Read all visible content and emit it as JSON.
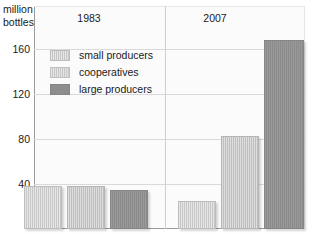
{
  "chart_data": {
    "type": "bar",
    "title": "",
    "subtitle": "",
    "xlabel": "",
    "ylabel": "million bottles",
    "ylabel_lines": [
      "million",
      "bottles"
    ],
    "categories": [
      "1983",
      "2007"
    ],
    "series": [
      {
        "name": "small producers",
        "values": [
          38,
          25
        ],
        "color": "#c7c7c7",
        "pattern": "vertical-hatch"
      },
      {
        "name": "cooperatives",
        "values": [
          38,
          83
        ],
        "color": "#c2c2c2",
        "pattern": "vertical-hatch"
      },
      {
        "name": "large producers",
        "values": [
          35,
          168
        ],
        "color": "#8e8e8e",
        "pattern": "solid"
      }
    ],
    "ylim": [
      0,
      180
    ],
    "yticks": [
      40,
      80,
      120,
      160
    ],
    "ytick_labels": [
      "40",
      "80",
      "120",
      "160"
    ],
    "grid": "horizontal",
    "legend_position": "inside-top-left",
    "group_separator": true
  },
  "axis": {
    "title_line1": "million",
    "title_line2": "bottles",
    "ticks": [
      {
        "label": "160",
        "value": 160
      },
      {
        "label": "120",
        "value": 120
      },
      {
        "label": "80",
        "value": 80
      },
      {
        "label": "40",
        "value": 40
      }
    ]
  },
  "groups": [
    {
      "label": "1983"
    },
    {
      "label": "2007"
    }
  ],
  "legend": {
    "items": [
      {
        "label": "small producers",
        "swatch": "small"
      },
      {
        "label": "cooperatives",
        "swatch": "coop"
      },
      {
        "label": "large producers",
        "swatch": "large"
      }
    ]
  },
  "bars": [
    {
      "name": "bar-1983-small-producers",
      "group": "1983",
      "series": "small producers",
      "value": 38,
      "left": 24,
      "width": 38
    },
    {
      "name": "bar-1983-cooperatives",
      "group": "1983",
      "series": "cooperatives",
      "value": 38,
      "left": 67,
      "width": 38
    },
    {
      "name": "bar-1983-large-producers",
      "group": "1983",
      "series": "large producers",
      "value": 35,
      "left": 110,
      "width": 38
    },
    {
      "name": "bar-2007-small-producers",
      "group": "2007",
      "series": "small producers",
      "value": 25,
      "left": 178,
      "width": 38
    },
    {
      "name": "bar-2007-cooperatives",
      "group": "2007",
      "series": "cooperatives",
      "value": 83,
      "left": 221,
      "width": 38
    },
    {
      "name": "bar-2007-large-producers",
      "group": "2007",
      "series": "large producers",
      "value": 168,
      "left": 264,
      "width": 40
    }
  ],
  "colors": {
    "small_producers": "#c7c7c7",
    "cooperatives": "#c2c2c2",
    "large_producers": "#8e8e8e",
    "gridline": "#d9d9d9",
    "axis": "#9a9a9a",
    "plot_background": "#fbfbfb",
    "text": "#1a1a1a"
  }
}
